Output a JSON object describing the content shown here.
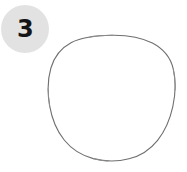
{
  "canvas": {
    "width": 187,
    "height": 172,
    "background_color": "#ffffff"
  },
  "step_badge": {
    "number": "3",
    "shape": "circle",
    "background_color": "#e2e2e2",
    "text_color": "#151515",
    "diameter_px": 48,
    "center_x": 25,
    "center_y": 29
  },
  "illustration": {
    "subject_name": "hand-drawn circle outline",
    "icon_name": "circle-outline-icon",
    "stroke_color": "#6f6f6f",
    "fill_color": "none",
    "stroke_width": 1.1,
    "bounds": {
      "left": 52,
      "top": 35,
      "right": 168,
      "bottom": 160
    },
    "alt_text": "Thin irregular circle outline"
  }
}
